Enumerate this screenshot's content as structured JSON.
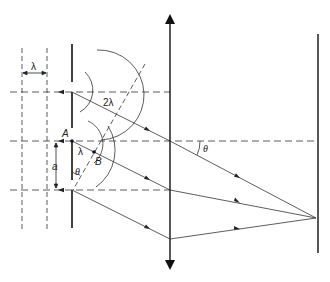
{
  "figure": {
    "type": "single-slit diffraction geometry with converging lens and screen",
    "labels": {
      "wavelength_spacing": "λ",
      "path_difference_2": "2λ",
      "path_difference_1": "λ",
      "point_a": "A",
      "point_b": "B",
      "slit_width": "a",
      "angle_lower": "θ",
      "angle_lens": "θ"
    },
    "colors": {
      "line": "#222222",
      "background": "#ffffff"
    }
  }
}
